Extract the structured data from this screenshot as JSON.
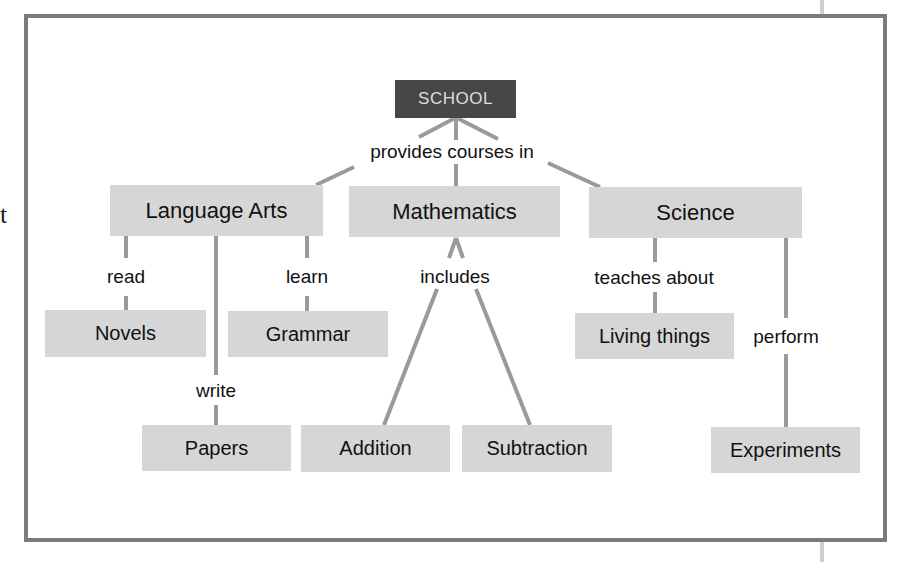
{
  "diagram": {
    "type": "concept-map",
    "edge_glyph": "t",
    "colors": {
      "frame": "#7b7b7b",
      "node_fill": "#d6d6d6",
      "root_fill": "#474747",
      "root_text": "#dedede",
      "link": "#9a9a9a"
    },
    "root": {
      "id": "school",
      "label": "SCHOOL"
    },
    "nodes": {
      "language_arts": "Language Arts",
      "mathematics": "Mathematics",
      "science": "Science",
      "novels": "Novels",
      "grammar": "Grammar",
      "papers": "Papers",
      "addition": "Addition",
      "subtraction": "Subtraction",
      "living_things": "Living things",
      "experiments": "Experiments"
    },
    "link_labels": {
      "provides_courses_in": "provides courses in",
      "read": "read",
      "learn": "learn",
      "write": "write",
      "includes": "includes",
      "teaches_about": "teaches about",
      "perform": "perform"
    },
    "edges": [
      {
        "from": "SCHOOL",
        "label": "provides courses in",
        "to": [
          "Language Arts",
          "Mathematics",
          "Science"
        ]
      },
      {
        "from": "Language Arts",
        "label": "read",
        "to": [
          "Novels"
        ]
      },
      {
        "from": "Language Arts",
        "label": "write",
        "to": [
          "Papers"
        ]
      },
      {
        "from": "Language Arts",
        "label": "learn",
        "to": [
          "Grammar"
        ]
      },
      {
        "from": "Mathematics",
        "label": "includes",
        "to": [
          "Addition",
          "Subtraction"
        ]
      },
      {
        "from": "Science",
        "label": "teaches about",
        "to": [
          "Living things"
        ]
      },
      {
        "from": "Science",
        "label": "perform",
        "to": [
          "Experiments"
        ]
      }
    ]
  }
}
